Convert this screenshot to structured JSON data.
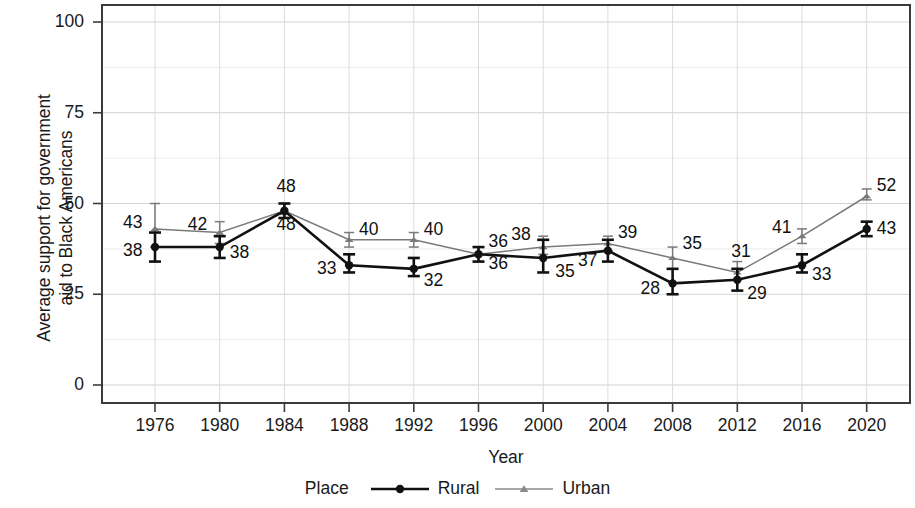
{
  "chart_data": {
    "type": "line",
    "title": "",
    "xlabel": "Year",
    "ylabel": "Average support for government aid to Black Americans",
    "categories": [
      1976,
      1980,
      1984,
      1988,
      1992,
      1996,
      2000,
      2004,
      2008,
      2012,
      2016,
      2020
    ],
    "xtick_labels": [
      "1976",
      "1980",
      "1984",
      "1988",
      "1992",
      "1996",
      "2000",
      "2004",
      "2008",
      "2012",
      "2016",
      "2020"
    ],
    "ytick_labels": [
      "0",
      "25",
      "50",
      "75",
      "100"
    ],
    "ytick_values": [
      0,
      25,
      50,
      75,
      100
    ],
    "ylim": [
      0,
      105
    ],
    "xlim": [
      1973,
      2023
    ],
    "grid": true,
    "legend_position": "bottom",
    "legend_title": "Place",
    "series": [
      {
        "name": "Rural",
        "marker": "circle",
        "color": "#111111",
        "values": [
          38,
          38,
          48,
          33,
          32,
          36,
          35,
          37,
          28,
          29,
          33,
          43
        ],
        "err_low": [
          34,
          35,
          46,
          31,
          30,
          34,
          31,
          34,
          25,
          26,
          31,
          41
        ],
        "err_high": [
          42,
          41,
          50,
          36,
          35,
          38,
          40,
          40,
          32,
          32,
          36,
          45
        ],
        "labels": [
          "38",
          "38",
          "48",
          "33",
          "32",
          "36",
          "35",
          "37",
          "28",
          "29",
          "33",
          "43"
        ]
      },
      {
        "name": "Urban",
        "marker": "triangle",
        "color": "#7a7a7a",
        "values": [
          43,
          42,
          48,
          40,
          40,
          36,
          38,
          39,
          35,
          31,
          41,
          52
        ],
        "err_low": [
          38,
          39,
          47,
          38,
          38,
          34,
          36,
          37,
          32,
          29,
          39,
          51
        ],
        "err_high": [
          50,
          45,
          50,
          42,
          42,
          38,
          41,
          41,
          38,
          34,
          43,
          54
        ],
        "labels": [
          "43",
          "42",
          "48",
          "40",
          "40",
          "36",
          "38",
          "39",
          "35",
          "31",
          "41",
          "52"
        ]
      }
    ]
  },
  "axis": {
    "ylabel_line1": "Average support for government",
    "ylabel_line2": "aid to Black Americans",
    "xlabel": "Year"
  },
  "legend": {
    "title": "Place",
    "items": [
      {
        "label": "Rural",
        "marker": "circle",
        "color": "#111111"
      },
      {
        "label": "Urban",
        "marker": "triangle",
        "color": "#7a7a7a"
      }
    ]
  }
}
